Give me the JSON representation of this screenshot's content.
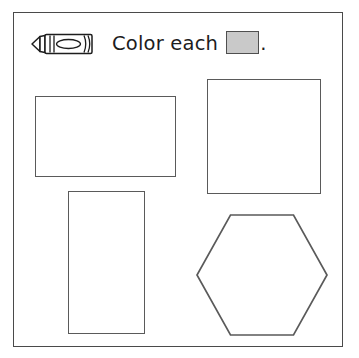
{
  "worksheet": {
    "instruction": {
      "icon": "crayon-icon",
      "text": "Color each",
      "swatch_label": "",
      "swatch_fill_color": "#c9c9c9",
      "swatch_border_color": "#4f4f4f",
      "terminator": "."
    },
    "frame": {
      "border_color": "#4a4a4a"
    },
    "shape_outline_color": "#5a5a5a",
    "shapes": [
      {
        "name": "wide-rectangle",
        "type": "rectangle",
        "label": "",
        "x": 34,
        "y": 95,
        "width": 141,
        "height": 81
      },
      {
        "name": "square",
        "type": "square",
        "label": "",
        "x": 206,
        "y": 78,
        "width": 114,
        "height": 115
      },
      {
        "name": "tall-rectangle",
        "type": "rectangle",
        "label": "",
        "x": 67,
        "y": 190,
        "width": 77,
        "height": 143
      },
      {
        "name": "hexagon",
        "type": "hexagon",
        "label": "",
        "x": 194,
        "y": 212,
        "width": 134,
        "height": 124
      }
    ]
  }
}
